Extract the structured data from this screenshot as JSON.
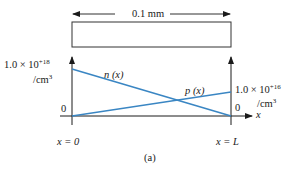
{
  "sample": {
    "width_label": "0.1 mm"
  },
  "axes": {
    "left": {
      "max_label_base": "1.0 × 10",
      "max_label_exp": "+18",
      "unit": "/cm",
      "unit_exp": "3",
      "zero_label": "0",
      "x_label": "x = 0"
    },
    "right": {
      "max_label_base": "1.0 × 10",
      "max_label_exp": "+16",
      "unit": "/cm",
      "unit_exp": "3",
      "zero_label": "0",
      "x_label": "x = L"
    },
    "x_axis_label": "x"
  },
  "curves": {
    "n": {
      "label": "n (x)",
      "from": "1.0e18 at x=0",
      "to": "0 at x=L"
    },
    "p": {
      "label": "p (x)",
      "from": "0 at x=0",
      "to": "1.0e16 at x=L"
    }
  },
  "colors": {
    "curve": "#3a86c3",
    "axis": "#1a1a1a"
  },
  "caption": "(a)"
}
